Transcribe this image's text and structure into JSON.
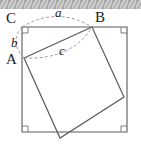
{
  "figure": {
    "background_color": "#ffffff",
    "top_bar": {
      "name": "hatched-strip",
      "fill_color": "#a8a8a8",
      "stripe_color": "#cfcfcf",
      "height_px": 9
    },
    "stroke_color": "#555555",
    "dashed_color": "#8a8a8a",
    "outer_square": {
      "label": "outer-square",
      "corners": [
        [
          22,
          27
        ],
        [
          127,
          27
        ],
        [
          127,
          132
        ],
        [
          22,
          132
        ]
      ],
      "right_angle_markers": 4,
      "marker_size_px": 6
    },
    "inner_square": {
      "label": "inner-tilted-square",
      "vertices": [
        [
          24,
          58
        ],
        [
          92,
          27
        ],
        [
          124,
          97
        ],
        [
          60,
          138
        ]
      ]
    },
    "vertex_labels": [
      {
        "id": "C",
        "text": "C",
        "x": 8,
        "y": 22
      },
      {
        "id": "B",
        "text": "B",
        "x": 96,
        "y": 21
      },
      {
        "id": "A",
        "text": "A",
        "x": 8,
        "y": 63
      }
    ],
    "side_labels": [
      {
        "id": "a",
        "text": "a",
        "x": 57,
        "y": 16
      },
      {
        "id": "b",
        "text": "b",
        "x": 12,
        "y": 45
      },
      {
        "id": "c",
        "text": "c",
        "x": 60,
        "y": 53
      }
    ],
    "arcs": [
      {
        "id": "arc-a",
        "from": "C",
        "to": "B",
        "style": "dashed",
        "path": "M 22,27 Q 57,6 92,27"
      },
      {
        "id": "arc-b",
        "from": "C",
        "to": "A",
        "style": "dashed",
        "path": "M 22,27 Q 10,42 24,58"
      },
      {
        "id": "arc-c",
        "from": "A",
        "to": "B",
        "style": "dashed",
        "path": "M 24,58 Q 70,58 92,27"
      }
    ]
  }
}
